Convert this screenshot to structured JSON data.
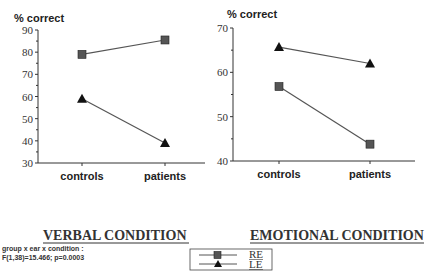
{
  "chart_data": [
    {
      "type": "line",
      "title": "VERBAL CONDITION",
      "ylabel": "% correct",
      "xlabel": "",
      "categories": [
        "controls",
        "patients"
      ],
      "ylim": [
        30,
        90
      ],
      "yticks": [
        30,
        40,
        50,
        60,
        70,
        80,
        90
      ],
      "series": [
        {
          "name": "RE",
          "marker": "square",
          "values": [
            79,
            85.5
          ]
        },
        {
          "name": "LE",
          "marker": "triangle",
          "values": [
            59,
            39
          ]
        }
      ]
    },
    {
      "type": "line",
      "title": "EMOTIONAL CONDITION",
      "ylabel": "% correct",
      "xlabel": "",
      "categories": [
        "controls",
        "patients"
      ],
      "ylim": [
        40,
        70
      ],
      "yticks": [
        40,
        50,
        60,
        70
      ],
      "series": [
        {
          "name": "RE",
          "marker": "square",
          "values": [
            56.8,
            43.8
          ]
        },
        {
          "name": "LE",
          "marker": "triangle",
          "values": [
            65.7,
            62
          ]
        }
      ]
    }
  ],
  "legend": {
    "items": [
      {
        "label": "RE",
        "marker": "square"
      },
      {
        "label": "LE",
        "marker": "triangle"
      }
    ]
  },
  "statistic": {
    "line1": "group x ear x condition :",
    "line2": "F(1,38)=15.466; p=0.0003"
  },
  "colors": {
    "square": "#555555",
    "triangle": "#111111",
    "line": "#555555",
    "axis": "#333333"
  }
}
